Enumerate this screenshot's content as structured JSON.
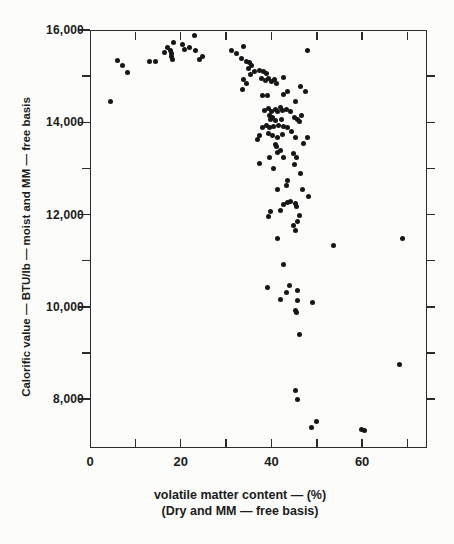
{
  "colors": {
    "paper": "#fcfcfa",
    "ink": "#1e1e1e",
    "marker": "#161616"
  },
  "chart_data": {
    "type": "scatter",
    "title": "",
    "xlabel": "volatile matter content — (%)",
    "xlabel2": "(Dry and MM — free basis)",
    "ylabel": "Calorific value — BTU/lb — moist and MM — free basis",
    "grid": false,
    "legend": "none",
    "marker": {
      "shape": "circle",
      "size_px": 5,
      "color": "#161616"
    },
    "x_axis": {
      "min": 0,
      "max": 74.3,
      "ticks": [
        10,
        20,
        30,
        40,
        50,
        60,
        70
      ],
      "labels": [
        {
          "value": 0,
          "text": "0"
        },
        {
          "value": 20,
          "text": "20"
        },
        {
          "value": 40,
          "text": "40"
        },
        {
          "value": 60,
          "text": "60"
        }
      ]
    },
    "y_axis": {
      "min": 6940,
      "max": 16000,
      "left_major": [
        16000,
        14000,
        12000,
        10000,
        8000
      ],
      "left_minor": [
        15000,
        13000,
        11000,
        9000
      ],
      "right_ticks": [
        15000,
        14000,
        13000,
        12000,
        11000,
        10000,
        9000,
        8000
      ],
      "labels": [
        {
          "value": 16000,
          "text": "16,000"
        },
        {
          "value": 14000,
          "text": "14,000"
        },
        {
          "value": 12000,
          "text": "12,000"
        },
        {
          "value": 10000,
          "text": "10,000"
        },
        {
          "value": 8000,
          "text": "8,000"
        }
      ]
    },
    "points": [
      [
        4.5,
        14440
      ],
      [
        6.1,
        15330
      ],
      [
        7.2,
        15240
      ],
      [
        8.3,
        15070
      ],
      [
        13.1,
        15310
      ],
      [
        14.4,
        15310
      ],
      [
        16.4,
        15520
      ],
      [
        17.1,
        15630
      ],
      [
        17.8,
        15550
      ],
      [
        18.0,
        15480
      ],
      [
        18.0,
        15420
      ],
      [
        18.2,
        15370
      ],
      [
        18.4,
        15720
      ],
      [
        20.4,
        15680
      ],
      [
        20.8,
        15570
      ],
      [
        21.9,
        15630
      ],
      [
        23.0,
        15870
      ],
      [
        23.3,
        15550
      ],
      [
        24.1,
        15370
      ],
      [
        24.8,
        15420
      ],
      [
        31.2,
        15550
      ],
      [
        32.3,
        15500
      ],
      [
        33.9,
        15650
      ],
      [
        33.4,
        15390
      ],
      [
        34.5,
        15310
      ],
      [
        35.2,
        15290
      ],
      [
        35.6,
        15220
      ],
      [
        35.0,
        15160
      ],
      [
        36.3,
        15090
      ],
      [
        35.4,
        15030
      ],
      [
        33.9,
        14920
      ],
      [
        34.5,
        14850
      ],
      [
        33.6,
        14720
      ],
      [
        37.4,
        15130
      ],
      [
        38.3,
        15090
      ],
      [
        38.9,
        15050
      ],
      [
        37.8,
        14940
      ],
      [
        38.7,
        14900
      ],
      [
        39.4,
        14940
      ],
      [
        40.0,
        14880
      ],
      [
        40.7,
        14920
      ],
      [
        41.1,
        14850
      ],
      [
        42.7,
        14980
      ],
      [
        43.6,
        14660
      ],
      [
        46.4,
        14770
      ],
      [
        47.5,
        14660
      ],
      [
        48.0,
        15550
      ],
      [
        38.0,
        14570
      ],
      [
        39.1,
        14570
      ],
      [
        42.7,
        14610
      ],
      [
        45.3,
        14440
      ],
      [
        38.5,
        14250
      ],
      [
        39.4,
        14290
      ],
      [
        40.0,
        14230
      ],
      [
        40.9,
        14270
      ],
      [
        41.3,
        14230
      ],
      [
        42.0,
        14310
      ],
      [
        42.4,
        14250
      ],
      [
        43.3,
        14270
      ],
      [
        44.2,
        14230
      ],
      [
        39.6,
        14140
      ],
      [
        40.2,
        14100
      ],
      [
        39.8,
        14050
      ],
      [
        40.9,
        14030
      ],
      [
        42.2,
        14050
      ],
      [
        45.1,
        14100
      ],
      [
        45.8,
        14050
      ],
      [
        46.2,
        14010
      ],
      [
        46.6,
        14140
      ],
      [
        38.9,
        13920
      ],
      [
        38.0,
        13880
      ],
      [
        39.6,
        13880
      ],
      [
        40.5,
        13900
      ],
      [
        41.6,
        13920
      ],
      [
        42.7,
        13900
      ],
      [
        43.6,
        13880
      ],
      [
        44.4,
        13810
      ],
      [
        37.4,
        13710
      ],
      [
        39.4,
        13750
      ],
      [
        40.2,
        13710
      ],
      [
        41.3,
        13680
      ],
      [
        42.4,
        13730
      ],
      [
        36.9,
        13620
      ],
      [
        40.9,
        13510
      ],
      [
        45.3,
        13660
      ],
      [
        48.0,
        13660
      ],
      [
        47.1,
        13550
      ],
      [
        41.1,
        13470
      ],
      [
        42.0,
        13380
      ],
      [
        41.3,
        13340
      ],
      [
        39.6,
        13230
      ],
      [
        42.7,
        13230
      ],
      [
        44.9,
        13320
      ],
      [
        45.5,
        13230
      ],
      [
        37.4,
        13100
      ],
      [
        40.5,
        12990
      ],
      [
        45.1,
        13080
      ],
      [
        46.4,
        12900
      ],
      [
        43.6,
        12730
      ],
      [
        43.3,
        12620
      ],
      [
        41.3,
        12540
      ],
      [
        46.9,
        12540
      ],
      [
        48.2,
        12390
      ],
      [
        44.2,
        12280
      ],
      [
        43.6,
        12260
      ],
      [
        42.7,
        12210
      ],
      [
        45.3,
        12230
      ],
      [
        45.5,
        12170
      ],
      [
        42.0,
        12080
      ],
      [
        39.8,
        12060
      ],
      [
        39.4,
        11950
      ],
      [
        46.2,
        11970
      ],
      [
        45.8,
        11840
      ],
      [
        44.9,
        11760
      ],
      [
        45.3,
        11650
      ],
      [
        41.3,
        11480
      ],
      [
        53.7,
        11330
      ],
      [
        68.9,
        11480
      ],
      [
        42.7,
        10910
      ],
      [
        39.1,
        10420
      ],
      [
        44.0,
        10460
      ],
      [
        43.3,
        10310
      ],
      [
        45.8,
        10350
      ],
      [
        42.0,
        10160
      ],
      [
        45.8,
        10130
      ],
      [
        49.1,
        10090
      ],
      [
        45.3,
        9920
      ],
      [
        45.5,
        9880
      ],
      [
        46.2,
        9400
      ],
      [
        68.2,
        8750
      ],
      [
        45.3,
        8190
      ],
      [
        45.8,
        7990
      ],
      [
        49.9,
        7520
      ],
      [
        48.8,
        7390
      ],
      [
        59.9,
        7340
      ],
      [
        60.5,
        7320
      ]
    ]
  }
}
